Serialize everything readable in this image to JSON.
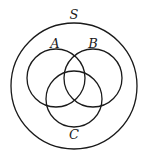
{
  "diagram": {
    "type": "venn",
    "universe": {
      "label": "S",
      "cx": 74,
      "cy": 86,
      "r": 63,
      "label_x": 74,
      "label_y": 19
    },
    "sets": [
      {
        "label": "A",
        "cx": 56,
        "cy": 78,
        "r": 29,
        "label_x": 55,
        "label_y": 48
      },
      {
        "label": "B",
        "cx": 93,
        "cy": 78,
        "r": 29,
        "label_x": 93,
        "label_y": 48
      },
      {
        "label": "C",
        "cx": 74,
        "cy": 99,
        "r": 28,
        "label_x": 74,
        "label_y": 139
      }
    ],
    "stroke_color": "#1a1a1a",
    "background": "#ffffff"
  }
}
